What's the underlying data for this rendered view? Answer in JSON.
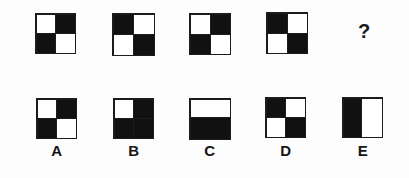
{
  "puzzle": {
    "type": "visual-analogy-pattern-matrix",
    "background_color": "#fdfdfd",
    "ink_color": "#111111",
    "missing_marker": "?",
    "sequence": [
      {
        "id": "seq-1",
        "shape": "quad",
        "x": 35,
        "y": 13,
        "size": 41,
        "quadrants": {
          "tl": "white",
          "tr": "black",
          "bl": "black",
          "br": "white"
        }
      },
      {
        "id": "seq-2",
        "shape": "quad",
        "x": 112,
        "y": 13,
        "size": 43,
        "quadrants": {
          "tl": "black",
          "tr": "white",
          "bl": "white",
          "br": "black"
        }
      },
      {
        "id": "seq-3",
        "shape": "quad",
        "x": 189,
        "y": 13,
        "size": 42,
        "quadrants": {
          "tl": "white",
          "tr": "black",
          "bl": "black",
          "br": "white"
        }
      },
      {
        "id": "seq-4",
        "shape": "quad",
        "x": 266,
        "y": 12,
        "size": 42,
        "quadrants": {
          "tl": "black",
          "tr": "white",
          "bl": "white",
          "br": "black"
        }
      },
      {
        "id": "seq-5",
        "shape": "question",
        "x": 343,
        "y": 13,
        "size": 42,
        "text": "?"
      }
    ],
    "options": [
      {
        "id": "option-a",
        "label": "A",
        "shape": "quad",
        "x": 36,
        "y": 98,
        "size": 41,
        "quadrants": {
          "tl": "white",
          "tr": "black",
          "bl": "black",
          "br": "white"
        }
      },
      {
        "id": "option-b",
        "label": "B",
        "shape": "quad",
        "x": 113,
        "y": 98,
        "size": 41,
        "quadrants": {
          "tl": "white",
          "tr": "black",
          "bl": "black",
          "br": "black"
        }
      },
      {
        "id": "option-c",
        "label": "C",
        "shape": "half-horizontal",
        "x": 189,
        "y": 98,
        "size": 42,
        "halves": {
          "top": "white",
          "bottom": "black"
        }
      },
      {
        "id": "option-d",
        "label": "D",
        "shape": "quad",
        "x": 265,
        "y": 97,
        "size": 41,
        "quadrants": {
          "tl": "black",
          "tr": "white",
          "bl": "white",
          "br": "black"
        }
      },
      {
        "id": "option-e",
        "label": "E",
        "shape": "half-vertical",
        "x": 342,
        "y": 97,
        "size": 41,
        "halves": {
          "left": "black",
          "right": "white"
        }
      }
    ],
    "label_positions": [
      {
        "x": 36,
        "y": 143
      },
      {
        "x": 113,
        "y": 143
      },
      {
        "x": 189,
        "y": 143
      },
      {
        "x": 265,
        "y": 143
      },
      {
        "x": 342,
        "y": 143
      }
    ]
  }
}
